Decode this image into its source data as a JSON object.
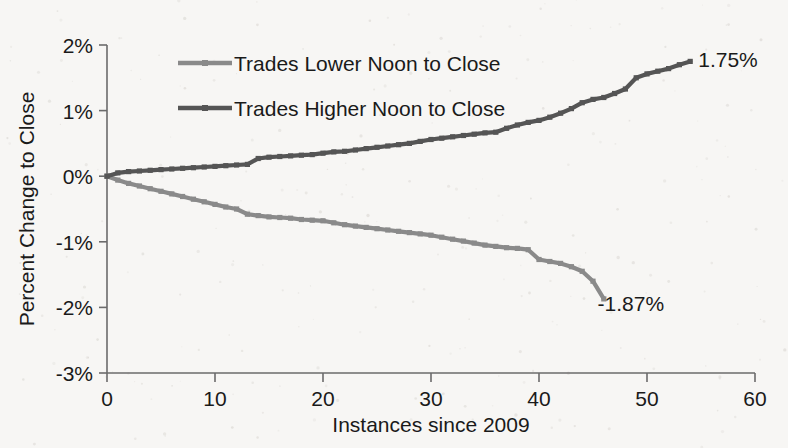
{
  "chart_data": {
    "type": "line",
    "title": "",
    "xlabel": "Instances since 2009",
    "ylabel": "Percent Change  to Close",
    "xlim": [
      0,
      60
    ],
    "ylim": [
      -3,
      2
    ],
    "xticks": [
      "0",
      "10",
      "20",
      "30",
      "40",
      "50",
      "60"
    ],
    "xtick_values": [
      0,
      10,
      20,
      30,
      40,
      50,
      60
    ],
    "yticks": [
      "2%",
      "1%",
      "0%",
      "-1%",
      "-2%",
      "-3%"
    ],
    "ytick_values": [
      2,
      1,
      0,
      -1,
      -2,
      -3
    ],
    "grid": false,
    "legend_position": "upper-left-inside",
    "units": "percent",
    "series": [
      {
        "name": "Trades Lower Noon to Close",
        "color": "#8a8a8a",
        "marker": "square",
        "end_label": "-1.87%",
        "x": [
          0,
          1,
          2,
          3,
          4,
          5,
          6,
          7,
          8,
          9,
          10,
          11,
          12,
          13,
          14,
          15,
          16,
          17,
          18,
          19,
          20,
          21,
          22,
          23,
          24,
          25,
          26,
          27,
          28,
          29,
          30,
          31,
          32,
          33,
          34,
          35,
          36,
          37,
          38,
          39,
          40,
          41,
          42,
          43,
          44,
          45,
          46
        ],
        "values": [
          0.0,
          -0.06,
          -0.11,
          -0.15,
          -0.19,
          -0.23,
          -0.27,
          -0.31,
          -0.35,
          -0.39,
          -0.43,
          -0.47,
          -0.5,
          -0.58,
          -0.6,
          -0.62,
          -0.63,
          -0.64,
          -0.66,
          -0.67,
          -0.68,
          -0.71,
          -0.74,
          -0.76,
          -0.78,
          -0.8,
          -0.82,
          -0.84,
          -0.86,
          -0.88,
          -0.9,
          -0.93,
          -0.96,
          -0.99,
          -1.02,
          -1.05,
          -1.07,
          -1.09,
          -1.1,
          -1.12,
          -1.27,
          -1.3,
          -1.33,
          -1.38,
          -1.45,
          -1.6,
          -1.87
        ]
      },
      {
        "name": "Trades Higher Noon to Close",
        "color": "#555555",
        "marker": "square",
        "end_label": "1.75%",
        "x": [
          0,
          1,
          2,
          3,
          4,
          5,
          6,
          7,
          8,
          9,
          10,
          11,
          12,
          13,
          14,
          15,
          16,
          17,
          18,
          19,
          20,
          21,
          22,
          23,
          24,
          25,
          26,
          27,
          28,
          29,
          30,
          31,
          32,
          33,
          34,
          35,
          36,
          37,
          38,
          39,
          40,
          41,
          42,
          43,
          44,
          45,
          46,
          47,
          48,
          49,
          50,
          51,
          52,
          53,
          54
        ],
        "values": [
          0.0,
          0.05,
          0.07,
          0.08,
          0.09,
          0.1,
          0.11,
          0.12,
          0.13,
          0.14,
          0.15,
          0.16,
          0.17,
          0.18,
          0.27,
          0.29,
          0.3,
          0.31,
          0.32,
          0.33,
          0.35,
          0.37,
          0.38,
          0.4,
          0.42,
          0.44,
          0.46,
          0.48,
          0.5,
          0.53,
          0.56,
          0.58,
          0.6,
          0.62,
          0.64,
          0.66,
          0.67,
          0.73,
          0.78,
          0.82,
          0.85,
          0.9,
          0.96,
          1.03,
          1.12,
          1.17,
          1.2,
          1.26,
          1.33,
          1.5,
          1.56,
          1.6,
          1.64,
          1.7,
          1.75
        ]
      }
    ],
    "annotations": [
      {
        "text": "1.75%",
        "x": 57.5,
        "y": 1.78
      },
      {
        "text": "-1.87%",
        "x": 48.5,
        "y": -1.93
      }
    ]
  },
  "legend": {
    "items": [
      {
        "label": "Trades Lower Noon to Close"
      },
      {
        "label": "Trades Higher Noon to Close"
      }
    ]
  }
}
